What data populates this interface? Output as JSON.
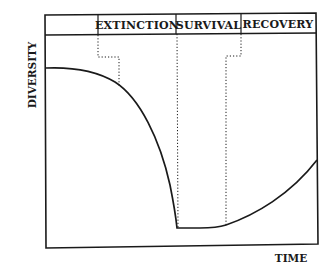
{
  "diagram": {
    "type": "phase-curve",
    "y_axis_label": "DIVERSITY",
    "x_axis_label": "TIME",
    "phases": [
      {
        "label": "EXTINCTION"
      },
      {
        "label": "SURVIVAL"
      },
      {
        "label": "RECOVERY"
      }
    ],
    "colors": {
      "line": "#1a1a1a",
      "background": "#ffffff"
    }
  }
}
